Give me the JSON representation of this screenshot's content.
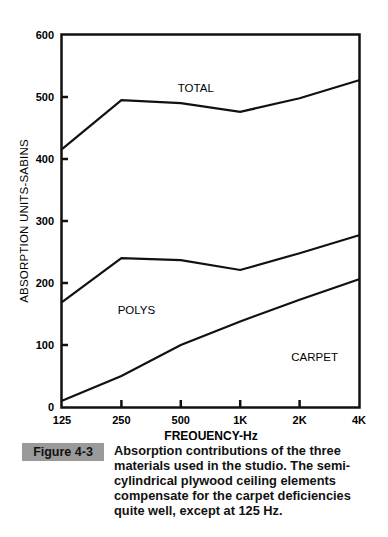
{
  "chart_data": {
    "type": "line",
    "title": "",
    "xlabel": "FREQUENCY-Hz",
    "ylabel": "ABSORPTION UNITS-SABINS",
    "categories": [
      "125",
      "250",
      "500",
      "1K",
      "2K",
      "4K"
    ],
    "yticks": [
      0,
      100,
      200,
      300,
      400,
      500,
      600
    ],
    "ylim": [
      0,
      600
    ],
    "grid": false,
    "legend": "inline labels",
    "series": [
      {
        "name": "TOTAL",
        "values": [
          416,
          495,
          490,
          476,
          498,
          527
        ]
      },
      {
        "name": "POLYS",
        "values": [
          169,
          240,
          237,
          221,
          248,
          277
        ]
      },
      {
        "name": "CARPET",
        "values": [
          10,
          50,
          100,
          138,
          173,
          206
        ]
      }
    ],
    "annotations": [
      {
        "text": "TOTAL",
        "near": "500",
        "y": 508
      },
      {
        "text": "POLYS",
        "near": "250",
        "y": 150
      },
      {
        "text": "CARPET",
        "near": "2K",
        "y": 75
      }
    ]
  },
  "caption": {
    "figure_label": "Figure 4-3",
    "text": "Absorption contributions of the three materials used in the studio. The semi-cylindrical plywood ceiling elements compensate for the carpet deficiencies quite well, except at 125 Hz."
  },
  "colors": {
    "line": "#111111",
    "badge_bg": "#9a9a9a"
  }
}
